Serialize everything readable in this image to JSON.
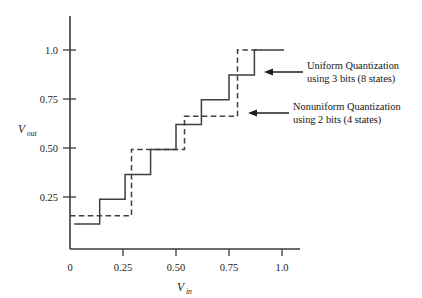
{
  "figure": {
    "title": "",
    "background": "#ffffff",
    "ink_color": "#3f3f3f"
  },
  "axes": {
    "x_label": "V",
    "x_sub": "in",
    "y_label": "V",
    "y_sub": "out",
    "x_ticks": [
      {
        "value": 0,
        "label": "0",
        "px": 70
      },
      {
        "value": 0.25,
        "label": "0.25",
        "px": 123
      },
      {
        "value": 0.5,
        "label": "0.50",
        "px": 176
      },
      {
        "value": 0.75,
        "label": "0.75",
        "px": 229
      },
      {
        "value": 1.0,
        "label": "1.0",
        "px": 282
      }
    ],
    "y_ticks": [
      {
        "value": 0.25,
        "label": "0.25",
        "px": 197
      },
      {
        "value": 0.5,
        "label": "0.50",
        "px": 148
      },
      {
        "value": 0.75,
        "label": "0.75",
        "px": 99
      },
      {
        "value": 1.0,
        "label": "1.0",
        "px": 50
      }
    ],
    "origin_px": {
      "x": 70,
      "y": 249
    },
    "x_axis_end_px": 300,
    "y_axis_top_px": 16,
    "grid": false
  },
  "annotations": [
    {
      "name": "uniform-quantization-annotation",
      "line1": "Uniform Quantization",
      "line2": "using 3 bits (8 states)",
      "text_x": 307,
      "text_y1": 66,
      "text_y2": 79,
      "arrow_from_x": 303,
      "arrow_to_x": 264,
      "arrow_y": 72
    },
    {
      "name": "nonuniform-quantization-annotation",
      "line1": "Nonuniform Quantization",
      "line2": "using 2 bits (4 states)",
      "text_x": 293,
      "text_y1": 107,
      "text_y2": 120,
      "arrow_from_x": 289,
      "arrow_to_x": 248,
      "arrow_y": 113
    }
  ],
  "chart_data": {
    "type": "line",
    "xlabel": "V_in",
    "ylabel": "V_out",
    "xlim": [
      0,
      1.1
    ],
    "ylim": [
      0,
      1.05
    ],
    "grid": false,
    "legend_position": "annotation-arrows-right",
    "series": [
      {
        "name": "Uniform Quantization using 3 bits (8 states)",
        "style": "solid",
        "color": "#3f3f3f",
        "step_type": "staircase",
        "x_breakpoints": [
          0.0,
          0.07,
          0.14,
          0.26,
          0.38,
          0.5,
          0.62,
          0.75,
          0.87,
          1.0
        ],
        "y_levels": [
          0.125,
          0.25,
          0.375,
          0.5,
          0.625,
          0.75,
          0.875,
          1.0
        ],
        "points": [
          {
            "x": 0.02,
            "y": 0.125
          },
          {
            "x": 0.14,
            "y": 0.125
          },
          {
            "x": 0.14,
            "y": 0.25
          },
          {
            "x": 0.26,
            "y": 0.25
          },
          {
            "x": 0.26,
            "y": 0.375
          },
          {
            "x": 0.38,
            "y": 0.375
          },
          {
            "x": 0.38,
            "y": 0.5
          },
          {
            "x": 0.5,
            "y": 0.5
          },
          {
            "x": 0.5,
            "y": 0.625
          },
          {
            "x": 0.62,
            "y": 0.625
          },
          {
            "x": 0.62,
            "y": 0.75
          },
          {
            "x": 0.75,
            "y": 0.75
          },
          {
            "x": 0.75,
            "y": 0.875
          },
          {
            "x": 0.87,
            "y": 0.875
          },
          {
            "x": 0.87,
            "y": 1.0
          },
          {
            "x": 1.01,
            "y": 1.0
          }
        ]
      },
      {
        "name": "Nonuniform Quantization using 2 bits (4 states)",
        "style": "dashed",
        "color": "#3f3f3f",
        "step_type": "staircase",
        "x_breakpoints": [
          0.0,
          0.29,
          0.54,
          0.79,
          1.0
        ],
        "y_levels": [
          0.167,
          0.5,
          0.667,
          1.0
        ],
        "points": [
          {
            "x": 0.0,
            "y": 0.167
          },
          {
            "x": 0.29,
            "y": 0.167
          },
          {
            "x": 0.29,
            "y": 0.5
          },
          {
            "x": 0.54,
            "y": 0.5
          },
          {
            "x": 0.54,
            "y": 0.667
          },
          {
            "x": 0.79,
            "y": 0.667
          },
          {
            "x": 0.79,
            "y": 1.0
          },
          {
            "x": 0.9,
            "y": 1.0
          }
        ]
      }
    ]
  },
  "paths": {
    "solid_px": "M 74,231 L 104,231 L 104,197 L 125,197 L 125,173 L 149,173 L 149,148 L 176,148 L 176,124 L 201,124 L 201,99 L 229,99 L 229,75 L 252,75 L 252,50 L 285,50",
    "dashed_px": "M 70,216 L 133,216 L 133,148 L 185,148 L 185,116 L 238,116 L 238,41 L 268,41"
  }
}
